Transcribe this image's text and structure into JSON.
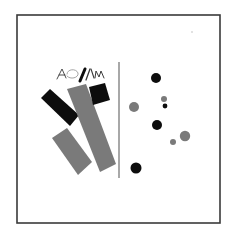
{
  "artwork": {
    "background": "#ffffff",
    "frame": {
      "x": 17,
      "y": 15,
      "width": 203,
      "height": 208,
      "stroke": "#3a3a3a",
      "stroke_width": 1.6
    },
    "speck": {
      "cx": 192,
      "cy": 32,
      "r": 0.8,
      "fill": "#bdbdbd"
    },
    "divider_line": {
      "x1": 119,
      "y1": 62,
      "x2": 119,
      "y2": 178,
      "stroke": "#6e6e6e",
      "stroke_width": 1.2
    },
    "scribble_text": "AO//\\m",
    "colors": {
      "black": "#0d0d0d",
      "gray": "#7a7a7a",
      "light_gray": "#8a8a8a"
    },
    "shapes": [
      {
        "name": "black-bar",
        "points": "41,98 50,89 79,115 70,126",
        "fill": "#0d0d0d"
      },
      {
        "name": "long-gray-bar",
        "points": "67,89 86,84 116,164 100,172",
        "fill": "#7a7a7a"
      },
      {
        "name": "short-gray-bar",
        "points": "52,138 67,128 92,162 78,175",
        "fill": "#7a7a7a"
      },
      {
        "name": "black-square",
        "points": "89,87 105,83 110,100 93,105",
        "fill": "#0d0d0d"
      }
    ],
    "circles": [
      {
        "cx": 156,
        "cy": 78,
        "r": 5,
        "fill": "#0d0d0d"
      },
      {
        "cx": 134,
        "cy": 107,
        "r": 5,
        "fill": "#7a7a7a"
      },
      {
        "cx": 164,
        "cy": 99,
        "r": 3,
        "fill": "#7a7a7a"
      },
      {
        "cx": 165,
        "cy": 106,
        "r": 2.4,
        "fill": "#0d0d0d"
      },
      {
        "cx": 157,
        "cy": 125,
        "r": 5,
        "fill": "#0d0d0d"
      },
      {
        "cx": 185,
        "cy": 136,
        "r": 5.2,
        "fill": "#7a7a7a"
      },
      {
        "cx": 173,
        "cy": 142,
        "r": 3,
        "fill": "#7a7a7a"
      },
      {
        "cx": 136,
        "cy": 168,
        "r": 5.5,
        "fill": "#0d0d0d"
      }
    ]
  }
}
